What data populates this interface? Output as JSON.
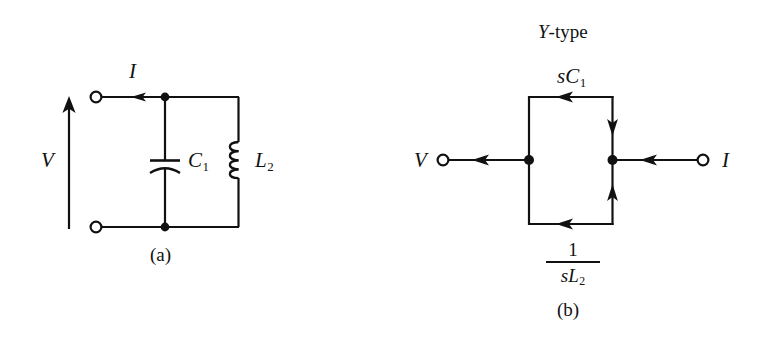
{
  "figure": {
    "background_color": "#ffffff",
    "ink_color": "#111111",
    "width": 757,
    "height": 345
  },
  "panel_a": {
    "caption": "(a)",
    "voltage_label": "V",
    "current_label": "I",
    "capacitor_label": "C",
    "capacitor_subscript": "1",
    "inductor_label": "L",
    "inductor_subscript": "2",
    "elements": [
      "input-terminal-top",
      "input-terminal-bottom",
      "voltage-arrow",
      "current-arrow",
      "capacitor-C1",
      "inductor-L2",
      "junction-dot-top",
      "junction-dot-bottom"
    ]
  },
  "panel_b": {
    "title": "Y-type",
    "title_italic_part": "Y",
    "title_roman_part": "-type",
    "caption": "(b)",
    "input_label": "V",
    "output_label": "I",
    "branch_top_label": "sC",
    "branch_top_subscript": "1",
    "branch_bottom_numerator": "1",
    "branch_bottom_denominator": "sL",
    "branch_bottom_subscript": "2",
    "elements": [
      "input-terminal",
      "output-terminal",
      "signal-flow-arrow-in",
      "signal-flow-arrow-out",
      "branch-arrow-top",
      "branch-arrow-right-down",
      "branch-arrow-right-up",
      "branch-arrow-bottom",
      "node-dot-left",
      "node-dot-right"
    ]
  }
}
